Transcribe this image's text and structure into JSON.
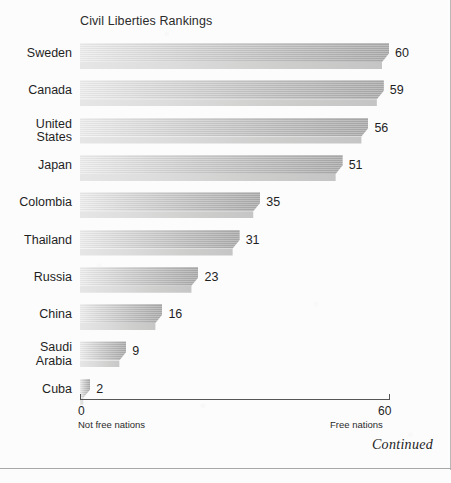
{
  "chart_data": {
    "type": "bar",
    "orientation": "horizontal",
    "title": "Civil Liberties Rankings",
    "categories": [
      "Sweden",
      "Canada",
      "United\nStates",
      "Japan",
      "Colombia",
      "Thailand",
      "Russia",
      "China",
      "Saudi\nArabia",
      "Cuba"
    ],
    "values": [
      60,
      59,
      56,
      51,
      35,
      31,
      23,
      16,
      9,
      2
    ],
    "xlabel": "",
    "ylabel": "",
    "xlim": [
      0,
      60
    ],
    "grid": false,
    "legend": null,
    "axis_ticks": [
      {
        "value": "0",
        "sublabel": "Not free nations"
      },
      {
        "value": "60",
        "sublabel": "Free nations"
      }
    ],
    "bar_color_light": "#ededed",
    "bar_color_dark": "#ababab"
  },
  "footer": {
    "continued_label": "Continued"
  }
}
